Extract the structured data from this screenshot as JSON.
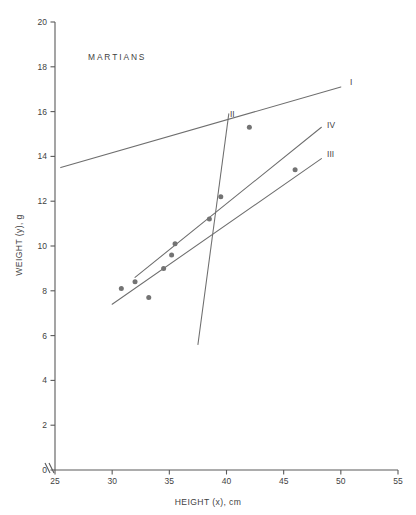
{
  "chart_data": {
    "type": "scatter",
    "title": "MARTIANS",
    "xlabel": "HEIGHT (x), cm",
    "ylabel": "WEIGHT (y), g",
    "xlim": [
      25,
      55
    ],
    "ylim": [
      0,
      20
    ],
    "xticks": [
      25,
      30,
      35,
      40,
      45,
      50,
      55
    ],
    "yticks": [
      0,
      2,
      4,
      6,
      8,
      10,
      12,
      14,
      16,
      18,
      20
    ],
    "xtick_labels": [
      "25",
      "30",
      "35",
      "40",
      "45",
      "50",
      "55"
    ],
    "ytick_labels": [
      "0",
      "2",
      "4",
      "6",
      "8",
      "10",
      "12",
      "14",
      "16",
      "18",
      "20"
    ],
    "grid": false,
    "legend": "inline-end-labels",
    "axis_break": {
      "axis": "x",
      "note": "break symbol between origin and first tick"
    },
    "points": [
      {
        "x": 30.8,
        "y": 8.1
      },
      {
        "x": 32.0,
        "y": 8.4
      },
      {
        "x": 33.2,
        "y": 7.7
      },
      {
        "x": 34.5,
        "y": 9.0
      },
      {
        "x": 35.2,
        "y": 9.6
      },
      {
        "x": 35.5,
        "y": 10.1
      },
      {
        "x": 38.5,
        "y": 11.2
      },
      {
        "x": 39.5,
        "y": 12.2
      },
      {
        "x": 42.0,
        "y": 15.3
      },
      {
        "x": 46.0,
        "y": 13.4
      }
    ],
    "series": [
      {
        "name": "I",
        "label": "I",
        "type": "line",
        "x": [
          25.5,
          50.0
        ],
        "values": [
          13.5,
          17.1
        ],
        "label_x": 50.8,
        "label_y": 17.3
      },
      {
        "name": "II",
        "label": "II",
        "type": "line",
        "x": [
          37.5,
          40.2
        ],
        "values": [
          5.6,
          15.9
        ],
        "label_x": 40.3,
        "label_y": 15.9
      },
      {
        "name": "III",
        "label": "III",
        "type": "line",
        "x": [
          30.0,
          48.3
        ],
        "values": [
          7.4,
          13.9
        ],
        "label_x": 48.8,
        "label_y": 14.1
      },
      {
        "name": "IV",
        "label": "IV",
        "type": "line",
        "x": [
          32.0,
          48.3
        ],
        "values": [
          8.6,
          15.3
        ],
        "label_x": 48.8,
        "label_y": 15.4
      }
    ]
  },
  "colors": {
    "ink": "#3f3f3f",
    "line": "#6e6e6e",
    "point": "#737373",
    "axis": "#5a5a5a",
    "background": "#ffffff"
  }
}
